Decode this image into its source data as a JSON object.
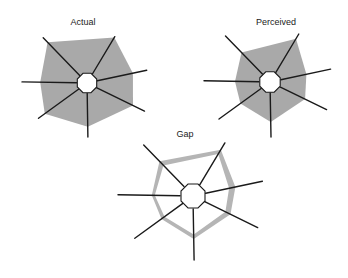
{
  "chart_data": [
    {
      "type": "radar",
      "title": "Actual",
      "axes": [
        "axis-1",
        "axis-2",
        "axis-3",
        "axis-4",
        "axis-5",
        "axis-6",
        "axis-7"
      ],
      "axis_labels_visible": false,
      "range": [
        0,
        1
      ],
      "series": [
        {
          "name": "Actual",
          "style": "filled",
          "values": [
            0.9,
            0.98,
            0.77,
            0.8,
            0.81,
            0.87,
            0.72
          ]
        }
      ]
    },
    {
      "type": "radar",
      "title": "Perceived",
      "axes": [
        "axis-1",
        "axis-2",
        "axis-3",
        "axis-4",
        "axis-5",
        "axis-6",
        "axis-7"
      ],
      "axis_labels_visible": false,
      "range": [
        0,
        1
      ],
      "series": [
        {
          "name": "Perceived",
          "style": "filled",
          "values": [
            0.64,
            0.9,
            0.6,
            0.62,
            0.73,
            0.58,
            0.53
          ]
        }
      ]
    },
    {
      "type": "radar",
      "title": "Gap",
      "axes": [
        "axis-1",
        "axis-2",
        "axis-3",
        "axis-4",
        "axis-5",
        "axis-6",
        "axis-7"
      ],
      "axis_labels_visible": false,
      "range": [
        0,
        1
      ],
      "series": [
        {
          "name": "Gap outer",
          "style": "band-outer",
          "values": [
            0.68,
            0.87,
            0.61,
            0.58,
            0.67,
            0.54,
            0.55
          ]
        },
        {
          "name": "Gap inner",
          "style": "band-inner",
          "values": [
            0.6,
            0.79,
            0.52,
            0.5,
            0.6,
            0.49,
            0.51
          ]
        }
      ]
    }
  ],
  "colors": {
    "fill": "#a9a9a9",
    "band": "#b5b5b5",
    "axis": "#1a1a1a",
    "background": "#ffffff"
  }
}
